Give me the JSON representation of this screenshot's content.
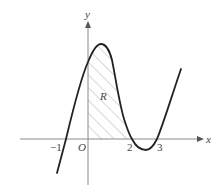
{
  "diagram": {
    "type": "function-graph",
    "axes": {
      "x_label": "x",
      "y_label": "y",
      "origin_label": "O",
      "x_ticks": [
        {
          "value": -1,
          "label": "−1"
        },
        {
          "value": 2,
          "label": "2"
        },
        {
          "value": 3,
          "label": "3"
        }
      ]
    },
    "curve": {
      "description": "cubic-shaped curve crossing x-axis near -1, 2 and 3, local max just right of y-axis, local min between 2 and 3",
      "x_intercepts_approx": [
        -0.9,
        2,
        3
      ]
    },
    "region": {
      "label": "R",
      "description": "hatched region bounded by the curve, the y-axis and the x-axis between x=0 and x=2"
    },
    "colors": {
      "curve": "#222222",
      "axes": "#888888",
      "hatch": "#999999",
      "background": "#ffffff"
    }
  }
}
